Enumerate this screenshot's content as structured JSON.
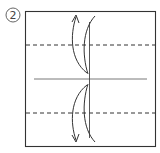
{
  "diagram": {
    "step_number": "2",
    "type": "origami-fold-instruction",
    "colors": {
      "stroke": "#333333",
      "background": "#ffffff"
    },
    "elements": {
      "paper_square": "square paper outline",
      "valley_fold_top": "dashed fold line (upper)",
      "valley_fold_bottom": "dashed fold line (lower)",
      "center_crease": "horizontal center crease",
      "arrow_up": "fold arrow pointing up",
      "arrow_down": "fold arrow pointing down"
    }
  }
}
